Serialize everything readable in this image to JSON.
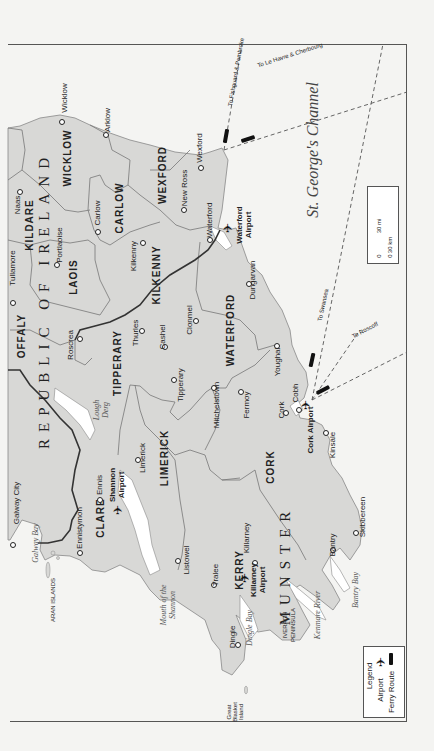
{
  "map": {
    "title": "Southern Ireland",
    "orientation": "rotated 90 degrees counter-clockwise (north to the left)",
    "colors": {
      "land": "#d8d8d6",
      "sea": "#ffffff",
      "background": "#f4f4f2",
      "border": "#555555",
      "national_border": "#333333",
      "county_border": "#777777"
    },
    "region_labels": [
      {
        "text": "REPUBLIC OF IRELAND",
        "x": 44,
        "y": 300
      },
      {
        "text": "MUNSTER",
        "x": 285,
        "y": 565
      }
    ],
    "county_labels": [
      {
        "text": "WICKLOW",
        "x": 68,
        "y": 158
      },
      {
        "text": "KILDARE",
        "x": 30,
        "y": 225
      },
      {
        "text": "CARLOW",
        "x": 120,
        "y": 208
      },
      {
        "text": "WEXFORD",
        "x": 163,
        "y": 175
      },
      {
        "text": "LAOIS",
        "x": 74,
        "y": 277
      },
      {
        "text": "KILKENNY",
        "x": 157,
        "y": 275
      },
      {
        "text": "OFFALY",
        "x": 22,
        "y": 336
      },
      {
        "text": "TIPPERARY",
        "x": 118,
        "y": 363
      },
      {
        "text": "WATERFORD",
        "x": 231,
        "y": 330
      },
      {
        "text": "CLARE",
        "x": 101,
        "y": 518
      },
      {
        "text": "LIMERICK",
        "x": 165,
        "y": 458
      },
      {
        "text": "CORK",
        "x": 271,
        "y": 467
      },
      {
        "text": "KERRY",
        "x": 240,
        "y": 570
      }
    ],
    "cities": [
      {
        "text": "Wicklow",
        "x": 65,
        "y": 98,
        "dot_x": 62,
        "dot_y": 122
      },
      {
        "text": "Arklow",
        "x": 108,
        "y": 120,
        "dot_x": 106,
        "dot_y": 135
      },
      {
        "text": "Wexford",
        "x": 200,
        "y": 148,
        "dot_x": 201,
        "dot_y": 168
      },
      {
        "text": "New Ross",
        "x": 185,
        "y": 188,
        "dot_x": 184,
        "dot_y": 210
      },
      {
        "text": "Waterford",
        "x": 210,
        "y": 220,
        "dot_x": 210,
        "dot_y": 240
      },
      {
        "text": "Naas",
        "x": 18,
        "y": 205,
        "dot_x": 20,
        "dot_y": 192
      },
      {
        "text": "Carlow",
        "x": 98,
        "y": 213,
        "dot_x": 98,
        "dot_y": 232
      },
      {
        "text": "Portlaoise",
        "x": 60,
        "y": 245,
        "dot_x": 57,
        "dot_y": 265
      },
      {
        "text": "Kilkenny",
        "x": 134,
        "y": 256,
        "dot_x": 143,
        "dot_y": 243
      },
      {
        "text": "Tullamore",
        "x": 13,
        "y": 268,
        "dot_x": 13,
        "dot_y": 303
      },
      {
        "text": "Roscrea",
        "x": 71,
        "y": 345,
        "dot_x": 80,
        "dot_y": 339
      },
      {
        "text": "Thurles",
        "x": 136,
        "y": 333,
        "dot_x": 142,
        "dot_y": 331
      },
      {
        "text": "Cashel",
        "x": 163,
        "y": 337,
        "dot_x": 165,
        "dot_y": 347
      },
      {
        "text": "Clonmel",
        "x": 190,
        "y": 320,
        "dot_x": 196,
        "dot_y": 321
      },
      {
        "text": "Dungarvan",
        "x": 253,
        "y": 280,
        "dot_x": 249,
        "dot_y": 284
      },
      {
        "text": "Tipperary",
        "x": 181,
        "y": 385,
        "dot_x": 174,
        "dot_y": 380
      },
      {
        "text": "Youghal",
        "x": 278,
        "y": 362,
        "dot_x": 277,
        "dot_y": 346
      },
      {
        "text": "Mitchelstown",
        "x": 217,
        "y": 405,
        "dot_x": 214,
        "dot_y": 388
      },
      {
        "text": "Fermoy",
        "x": 247,
        "y": 405,
        "dot_x": 241,
        "dot_y": 392
      },
      {
        "text": "Cobh",
        "x": 296,
        "y": 393,
        "dot_x": 299,
        "dot_y": 410
      },
      {
        "text": "Cork",
        "x": 282,
        "y": 410,
        "dot_x": 286,
        "dot_y": 413
      },
      {
        "text": "Kinsale",
        "x": 333,
        "y": 445,
        "dot_x": 326,
        "dot_y": 433
      },
      {
        "text": "Skibbereen",
        "x": 363,
        "y": 517,
        "dot_x": 356,
        "dot_y": 533
      },
      {
        "text": "Bantry",
        "x": 333,
        "y": 545,
        "dot_x": 333,
        "dot_y": 550
      },
      {
        "text": "Galway City",
        "x": 17,
        "y": 503,
        "dot_x": 13,
        "dot_y": 545
      },
      {
        "text": "Ennis",
        "x": 100,
        "y": 485,
        "dot_x": 100,
        "dot_y": 500
      },
      {
        "text": "Ennistymon",
        "x": 80,
        "y": 528,
        "dot_x": 80,
        "dot_y": 553
      },
      {
        "text": "Limerick",
        "x": 143,
        "y": 458,
        "dot_x": 138,
        "dot_y": 460
      },
      {
        "text": "Listowel",
        "x": 187,
        "y": 560,
        "dot_x": 178,
        "dot_y": 561
      },
      {
        "text": "Tralee",
        "x": 216,
        "y": 575,
        "dot_x": 214,
        "dot_y": 585
      },
      {
        "text": "Killarney",
        "x": 247,
        "y": 538,
        "dot_x": 255,
        "dot_y": 563
      },
      {
        "text": "Dingle",
        "x": 233,
        "y": 637,
        "dot_x": 238,
        "dot_y": 645
      }
    ],
    "airports": [
      {
        "text_1": "Waterford",
        "text_2": "Airport",
        "x1": 240,
        "x2": 249,
        "y": 225,
        "icon_x": 228,
        "icon_y": 228
      },
      {
        "text_1": "Shannon",
        "text_2": "Airport",
        "x1": 113,
        "x2": 122,
        "y": 485,
        "icon_x": 118,
        "icon_y": 510
      },
      {
        "text_1": "Cork Airport",
        "text_2": "",
        "x1": 311,
        "x2": 311,
        "y": 430,
        "icon_x": 306,
        "icon_y": 405
      },
      {
        "text_1": "Killarney",
        "text_2": "Airport",
        "x1": 254,
        "x2": 263,
        "y": 580,
        "icon_x": 245,
        "icon_y": 578
      }
    ],
    "water_labels": [
      {
        "text": "Galway Bay",
        "x": 36,
        "y": 543
      },
      {
        "text": "Lough",
        "x": 97,
        "y": 410
      },
      {
        "text": "Derg",
        "x": 106,
        "y": 410
      },
      {
        "text": "Mouth of the",
        "x": 164,
        "y": 605
      },
      {
        "text": "Shannon",
        "x": 173,
        "y": 605
      },
      {
        "text": "Dingle Bay",
        "x": 250,
        "y": 628
      },
      {
        "text": "Kenmare River",
        "x": 318,
        "y": 615
      },
      {
        "text": "Bantry Bay",
        "x": 356,
        "y": 590
      }
    ],
    "sea_labels": [
      {
        "text": "St. George's Channel",
        "x": 313,
        "y": 150
      }
    ],
    "island_labels": [
      {
        "text": "ARAN ISLANDS",
        "x": 53,
        "y": 600
      },
      {
        "text": "IVERAGH",
        "x": 285,
        "y": 625
      },
      {
        "text": "PENINSULA",
        "x": 293,
        "y": 625
      },
      {
        "text": "Great",
        "x": 229,
        "y": 712
      },
      {
        "text": "Blasket",
        "x": 235,
        "y": 712
      },
      {
        "text": "Island",
        "x": 241,
        "y": 712
      }
    ],
    "ferry_routes": [
      {
        "text": "To Fishguard & Pembroke",
        "x": 236,
        "y": 72
      },
      {
        "text": "To Le Havre & Cherbourg",
        "x": 290,
        "y": 55
      },
      {
        "text": "To Swansea",
        "x": 323,
        "y": 305
      },
      {
        "text": "To Roscoff",
        "x": 365,
        "y": 330
      }
    ],
    "scale": {
      "miles_label": "30 mi",
      "km_label": "30 km",
      "zero_label": "0"
    },
    "compass": {
      "icon": "north-arrow-icon"
    },
    "legend": {
      "title": "Legend",
      "items": [
        {
          "label": "Airport",
          "icon": "airplane-icon"
        },
        {
          "label": "Ferry Route",
          "icon": "ferry-icon"
        }
      ]
    }
  }
}
